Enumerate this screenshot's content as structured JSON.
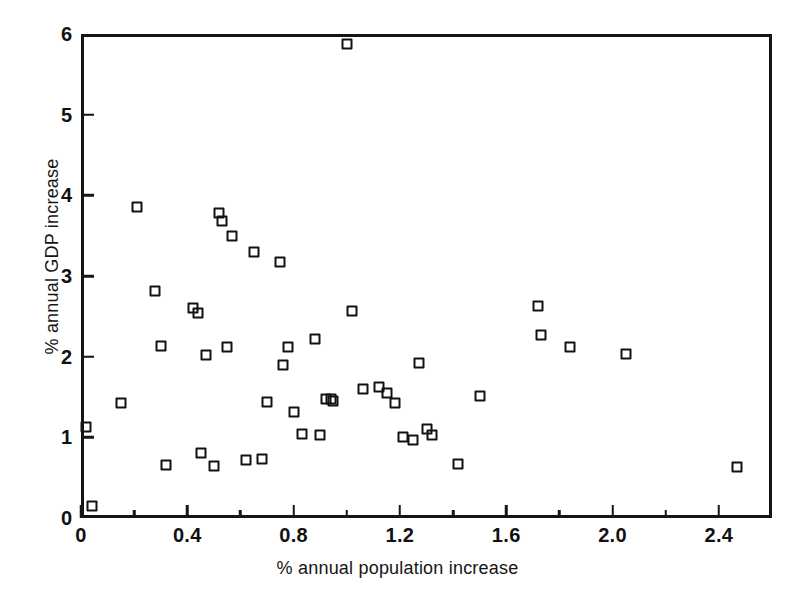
{
  "chart_data": {
    "type": "scatter",
    "title": "",
    "xlabel": "% annual population increase",
    "ylabel": "% annual GDP increase",
    "xlim": [
      0,
      2.6
    ],
    "ylim": [
      0,
      6
    ],
    "grid": false,
    "legend": null,
    "marker": "open-square",
    "marker_color": "#121212",
    "x_major_ticks": [
      0,
      0.4,
      0.8,
      1.2,
      1.6,
      2.0,
      2.4
    ],
    "x_major_tick_labels": [
      "0",
      "0.4",
      "0.8",
      "1.2",
      "1.6",
      "2.0",
      "2.4"
    ],
    "x_minor_ticks": [
      0.2,
      0.6,
      1.0,
      1.4,
      1.8,
      2.2
    ],
    "y_major_ticks": [
      0,
      1,
      2,
      3,
      4,
      5,
      6
    ],
    "y_major_tick_labels": [
      "0",
      "1",
      "2",
      "3",
      "4",
      "5",
      "6"
    ],
    "y_minor_ticks": [],
    "points": [
      [
        0.02,
        1.13
      ],
      [
        0.04,
        0.15
      ],
      [
        0.15,
        1.43
      ],
      [
        0.21,
        3.85
      ],
      [
        0.28,
        2.81
      ],
      [
        0.3,
        2.13
      ],
      [
        0.32,
        0.66
      ],
      [
        0.42,
        2.6
      ],
      [
        0.44,
        2.54
      ],
      [
        0.45,
        0.8
      ],
      [
        0.47,
        2.02
      ],
      [
        0.5,
        0.65
      ],
      [
        0.52,
        3.78
      ],
      [
        0.53,
        3.68
      ],
      [
        0.55,
        2.12
      ],
      [
        0.57,
        3.5
      ],
      [
        0.62,
        0.72
      ],
      [
        0.65,
        3.3
      ],
      [
        0.68,
        0.73
      ],
      [
        0.7,
        1.44
      ],
      [
        0.75,
        3.17
      ],
      [
        0.76,
        1.9
      ],
      [
        0.78,
        2.12
      ],
      [
        0.8,
        1.31
      ],
      [
        0.83,
        1.04
      ],
      [
        0.88,
        2.22
      ],
      [
        0.9,
        1.03
      ],
      [
        0.92,
        1.48
      ],
      [
        0.94,
        1.47
      ],
      [
        0.95,
        1.45
      ],
      [
        1.0,
        5.88
      ],
      [
        1.02,
        2.57
      ],
      [
        1.06,
        1.6
      ],
      [
        1.12,
        1.63
      ],
      [
        1.15,
        1.55
      ],
      [
        1.18,
        1.43
      ],
      [
        1.21,
        1.0
      ],
      [
        1.25,
        0.97
      ],
      [
        1.27,
        1.92
      ],
      [
        1.3,
        1.1
      ],
      [
        1.32,
        1.03
      ],
      [
        1.42,
        0.67
      ],
      [
        1.5,
        1.51
      ],
      [
        1.72,
        2.63
      ],
      [
        1.73,
        2.27
      ],
      [
        1.84,
        2.12
      ],
      [
        2.05,
        2.03
      ],
      [
        2.47,
        0.63
      ]
    ]
  }
}
